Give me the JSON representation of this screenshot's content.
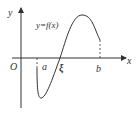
{
  "diagram": {
    "axis_labels": {
      "y": "y",
      "x": "x",
      "origin": "O"
    },
    "curve_label": "y=f(x)",
    "points": {
      "a": "a",
      "xi": "ξ",
      "b": "b"
    },
    "colors": {
      "stroke": "#333333",
      "background": "#ffffff"
    }
  }
}
